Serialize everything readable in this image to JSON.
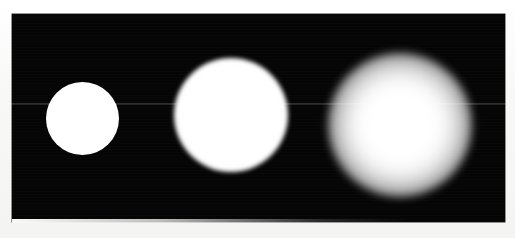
{
  "figure": {
    "canvas": {
      "width": 515,
      "height": 238,
      "background_color": "#fbfbfa"
    },
    "panel": {
      "label": "black image panel",
      "background_color": "#050505",
      "x": 12,
      "y": 14,
      "width": 493,
      "height": 208
    },
    "artifacts": {
      "scan_seam_label": "horizontal scan seam",
      "scan_seam_y": 103
    }
  },
  "chart_data": {
    "type": "scatter",
    "subtitle": "",
    "xlabel": "",
    "ylabel": "",
    "xlim": [
      12,
      505
    ],
    "ylim": [
      14,
      222
    ],
    "grid": false,
    "legend_position": "none",
    "background_color": "#050505",
    "marker_color": "#ffffff",
    "annotations": [],
    "categories": [
      "spot-1",
      "spot-2",
      "spot-3"
    ],
    "series": [
      {
        "name": "center_x",
        "values": [
          82,
          231,
          400
        ]
      },
      {
        "name": "center_y",
        "values": [
          118,
          115,
          125
        ]
      },
      {
        "name": "core_diameter_px",
        "values": [
          72,
          108,
          92
        ]
      },
      {
        "name": "outer_diameter_px",
        "values": [
          73,
          114,
          144
        ]
      },
      {
        "name": "edge_blur_px",
        "values": [
          1,
          9,
          30
        ]
      },
      {
        "name": "peak_brightness",
        "values": [
          255,
          255,
          255
        ]
      }
    ],
    "points": [
      {
        "id": "spot-1",
        "label": "small sharp spot",
        "x": 82,
        "y": 118,
        "core_diameter_px": 72,
        "outer_diameter_px": 73,
        "edge_blur_px": 1,
        "peak_brightness": 255,
        "color": "#ffffff"
      },
      {
        "id": "spot-2",
        "label": "medium softly blurred spot",
        "x": 231,
        "y": 115,
        "core_diameter_px": 108,
        "outer_diameter_px": 114,
        "edge_blur_px": 9,
        "peak_brightness": 255,
        "color": "#ffffff"
      },
      {
        "id": "spot-3",
        "label": "large strongly blurred spot",
        "x": 400,
        "y": 125,
        "core_diameter_px": 92,
        "outer_diameter_px": 144,
        "edge_blur_px": 30,
        "peak_brightness": 255,
        "color": "#ffffff"
      }
    ]
  }
}
